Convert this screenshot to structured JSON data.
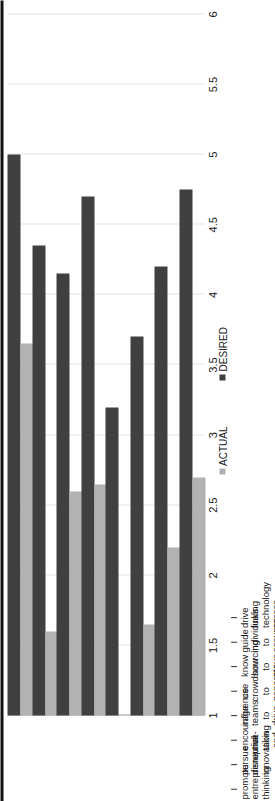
{
  "chart_data": {
    "type": "bar",
    "orientation": "horizontal",
    "rotation_deg": -90,
    "title": "",
    "subtitle": "",
    "xlabel": "",
    "ylabel": "",
    "grid": true,
    "legend_position": "bottom",
    "xlim": [
      1,
      6
    ],
    "tick_labels": [
      "1",
      "1.5",
      "2",
      "2.5",
      "3",
      "3.5",
      "4",
      "4.5",
      "5",
      "5.5",
      "6"
    ],
    "tick_values": [
      1,
      1.5,
      2,
      2.5,
      3,
      3.5,
      4,
      4.5,
      5,
      5.5,
      6
    ],
    "categories": [
      "I promote entrepreneurial thinking",
      "I pursue disruptive innovation",
      "I encourage risk-taking and experimentation",
      "I influence teams to drive innovation",
      "I use crowdsourcing to generate ideas for change",
      "I know how to move quickly and bring individuals and teams on board",
      "I guide individuals to assume innovation roles in my organization",
      "I drive linking technology across the value chain"
    ],
    "series": [
      {
        "name": "ACTUAL",
        "color": "#b2b2b2",
        "values": [
          3.65,
          1.6,
          2.6,
          2.65,
          1.0,
          1.65,
          2.2,
          2.7
        ]
      },
      {
        "name": "DESIRED",
        "color": "#404040",
        "values": [
          5.0,
          4.35,
          4.15,
          4.7,
          3.2,
          3.7,
          4.2,
          4.75
        ]
      }
    ]
  },
  "legend": {
    "items": [
      {
        "label": "ACTUAL",
        "color": "#b2b2b2"
      },
      {
        "label": "DESIRED",
        "color": "#404040"
      }
    ]
  },
  "colors": {
    "actual": "#b2b2b2",
    "desired": "#404040",
    "gridline": "#e3e3e3",
    "baseline": "#9a9a9a",
    "edge_rule": "#111111",
    "text": "#1a1a1a",
    "background": "#ffffff"
  }
}
